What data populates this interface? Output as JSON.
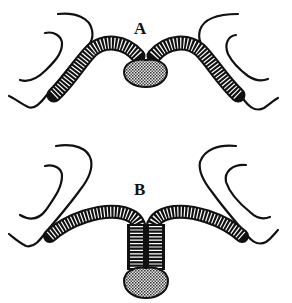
{
  "figure": {
    "panels": [
      {
        "id": "A",
        "label": "A",
        "description": "Commissure arched above, oval body directly beneath junction"
      },
      {
        "id": "B",
        "label": "B",
        "description": "Commissure joined into a descending stalk ending in oval body"
      }
    ]
  },
  "colors": {
    "ink": "#111111",
    "background": "#ffffff",
    "stipple": "#9a9a9a"
  }
}
